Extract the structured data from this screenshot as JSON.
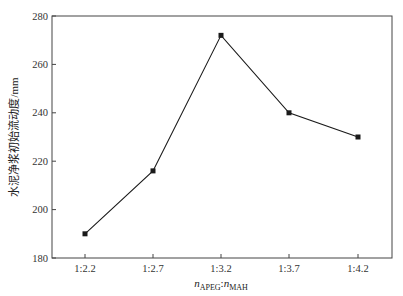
{
  "chart_data": {
    "type": "line",
    "title": "",
    "xlabel": "n_APEG : n_MAH",
    "xlabel_parts": {
      "n1": "n",
      "sub1": "APEG",
      "sep": ":",
      "n2": "n",
      "sub2": "MAH"
    },
    "ylabel": "水泥净浆初始流动度/mm",
    "categories": [
      "1:2.2",
      "1:2.7",
      "1:3.2",
      "1:3.7",
      "1:4.2"
    ],
    "series": [
      {
        "name": "初始流动度",
        "values": [
          190,
          216,
          272,
          240,
          230
        ],
        "marker": "square",
        "color": "#1a1a1a"
      }
    ],
    "ylim": [
      180,
      280
    ],
    "yticks": [
      180,
      200,
      220,
      240,
      260,
      280
    ],
    "grid": false,
    "legend": null
  }
}
